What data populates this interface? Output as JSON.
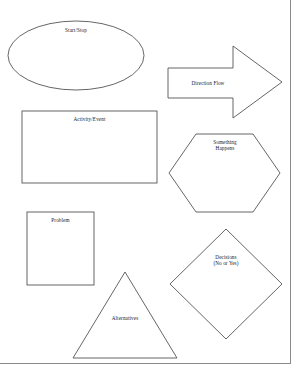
{
  "page": {
    "background_color": "#ffffff",
    "stroke_color": "#555555",
    "text_color": "#1a1a1a",
    "border": {
      "right_edge_x": 290,
      "bottom_edge_y": 364,
      "color": "#8a8a8a"
    }
  },
  "shapes": [
    {
      "id": "start-stop",
      "type": "ellipse",
      "label": "Start/Stop",
      "bounds": {
        "x": 8,
        "y": 21,
        "width": 136,
        "height": 69
      }
    },
    {
      "id": "direction-flow",
      "type": "arrow-right",
      "label": "Direction Flow",
      "bounds": {
        "x": 168,
        "y": 46,
        "width": 114,
        "height": 72
      }
    },
    {
      "id": "activity-event",
      "type": "rectangle",
      "label": "Activity/Event",
      "bounds": {
        "x": 22,
        "y": 111,
        "width": 135,
        "height": 72
      }
    },
    {
      "id": "something-happens",
      "type": "hexagon",
      "label": "Something\nHappens",
      "bounds": {
        "x": 169,
        "y": 134,
        "width": 111,
        "height": 78
      }
    },
    {
      "id": "problem",
      "type": "square",
      "label": "Problem",
      "bounds": {
        "x": 27,
        "y": 212,
        "width": 67,
        "height": 73
      }
    },
    {
      "id": "decisions",
      "type": "diamond",
      "label": "Decisions\n(No or Yes)",
      "bounds": {
        "x": 170,
        "y": 229,
        "width": 112,
        "height": 110
      }
    },
    {
      "id": "alternatives",
      "type": "triangle",
      "label": "Alternatives",
      "bounds": {
        "x": 73,
        "y": 272,
        "width": 104,
        "height": 86
      }
    }
  ]
}
